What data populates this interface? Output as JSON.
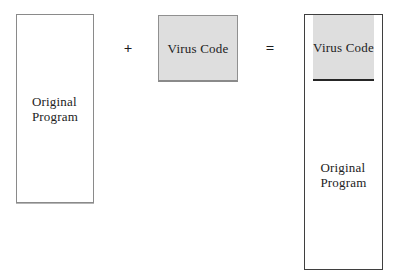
{
  "figure": {
    "colors": {
      "background": "#ffffff",
      "virus_fill": "#dedede",
      "light_border": "#8a8a8a",
      "dark_border": "#3f3f3f",
      "text": "#222222"
    }
  },
  "left_box": {
    "label": "Original\nProgram"
  },
  "operators": {
    "plus": "+",
    "equals": "="
  },
  "middle_box": {
    "label": "Virus Code"
  },
  "right_box": {
    "top_label": "Virus Code",
    "bottom_label": "Original\nProgram"
  }
}
